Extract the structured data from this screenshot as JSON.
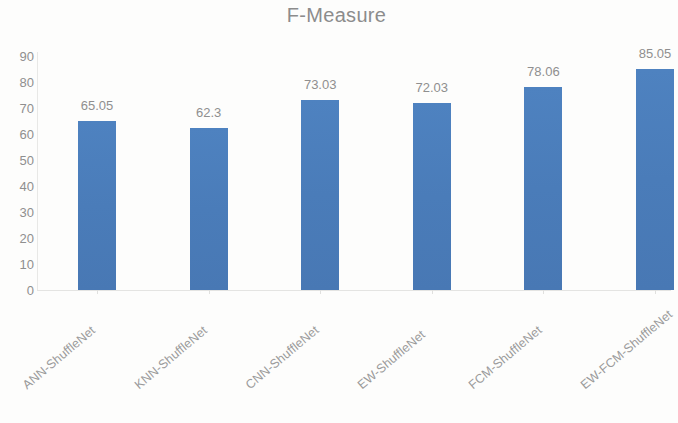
{
  "chart_data": {
    "type": "bar",
    "title": "F-Measure",
    "xlabel": "",
    "ylabel": "",
    "categories": [
      "ANN-ShuffleNet",
      "KNN-ShuffleNet",
      "CNN-ShuffleNet",
      "EW-ShuffleNet",
      "FCM-ShuffleNet",
      "EW-FCM-ShuffleNet"
    ],
    "values": [
      65.05,
      62.3,
      73.03,
      72.03,
      78.06,
      85.05
    ],
    "value_labels": [
      "65.05",
      "62.3",
      "73.03",
      "72.03",
      "78.06",
      "85.05"
    ],
    "ylim": [
      0,
      90
    ],
    "yticks": [
      90,
      80,
      70,
      60,
      50,
      40,
      30,
      20,
      10,
      0
    ],
    "ytick_labels": [
      "90",
      "80",
      "70",
      "60",
      "50",
      "40",
      "30",
      "20",
      "10",
      "0"
    ],
    "grid": false,
    "legend": null,
    "bar_color": "#4a7ebb",
    "text_color": "#8f8f8f",
    "title_color": "#8c8c8c",
    "background_color": "#fdfdfc"
  }
}
